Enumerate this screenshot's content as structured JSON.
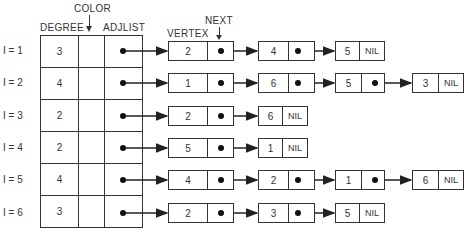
{
  "headers": {
    "color": "COLOR",
    "degree": "DEGREE",
    "adjlist": "ADJLIST",
    "next": "NEXT",
    "vertex": "VERTEX"
  },
  "rows": [
    {
      "label": "I = 1",
      "degree": "3",
      "adj": [
        "2",
        "4",
        "5"
      ],
      "nil": "NIL"
    },
    {
      "label": "I = 2",
      "degree": "4",
      "adj": [
        "1",
        "6",
        "5",
        "3"
      ],
      "nil": "NIL"
    },
    {
      "label": "I = 3",
      "degree": "2",
      "adj": [
        "2",
        "6"
      ],
      "nil": "NIL"
    },
    {
      "label": "I = 4",
      "degree": "2",
      "adj": [
        "5",
        "1"
      ],
      "nil": "NIL"
    },
    {
      "label": "I = 5",
      "degree": "4",
      "adj": [
        "4",
        "2",
        "1",
        "6"
      ],
      "nil": "NIL"
    },
    {
      "label": "I = 6",
      "degree": "3",
      "adj": [
        "2",
        "3",
        "5"
      ],
      "nil": "NIL"
    }
  ]
}
